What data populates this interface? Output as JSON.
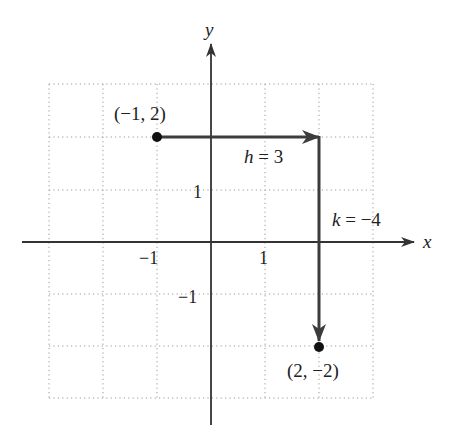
{
  "figure": {
    "axes": {
      "x_label": "x",
      "y_label": "y",
      "x_tick_labels": [
        {
          "value": -1,
          "text": "−1"
        },
        {
          "value": 1,
          "text": "1"
        }
      ],
      "y_tick_labels": [
        {
          "value": 1,
          "text": "1"
        },
        {
          "value": -1,
          "text": "−1"
        }
      ],
      "grid": {
        "x_range": [
          -3,
          3
        ],
        "y_range": [
          -3,
          3
        ],
        "style": "dotted"
      }
    },
    "points": [
      {
        "name": "start",
        "x": -1,
        "y": 2,
        "label": "(−1, 2)"
      },
      {
        "name": "end",
        "x": 2,
        "y": -2,
        "label": "(2, −2)"
      }
    ],
    "shifts": {
      "horizontal": {
        "label": "h = 3",
        "var": "h",
        "value": "3"
      },
      "vertical": {
        "label": "k = −4",
        "var": "k",
        "value": "−4"
      }
    },
    "colors": {
      "axis": "#333333",
      "arrow": "#3c3c3c",
      "grid": "#9a9a9a",
      "point": "#111111",
      "text": "#222222"
    }
  }
}
